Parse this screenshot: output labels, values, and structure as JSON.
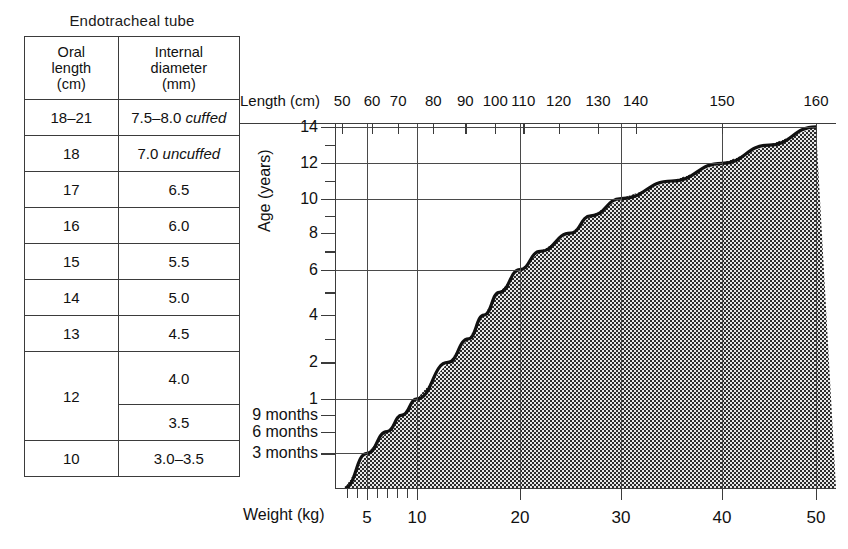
{
  "table": {
    "title": "Endotracheal tube",
    "headers": [
      "Oral\nlength\n(cm)",
      "Internal\ndiameter\n(mm)"
    ],
    "header_oral_line1": "Oral",
    "header_oral_line2": "length",
    "header_oral_line3": "(cm)",
    "header_diam_line1": "Internal",
    "header_diam_line2": "diameter",
    "header_diam_line3": "(mm)",
    "rows": [
      {
        "oral": "18–21",
        "diameter": "7.5–8.0 ",
        "diameter_note": "cuffed"
      },
      {
        "oral": "18",
        "diameter": "7.0 ",
        "diameter_note": "uncuffed"
      },
      {
        "oral": "17",
        "diameter": "6.5",
        "diameter_note": ""
      },
      {
        "oral": "16",
        "diameter": "6.0",
        "diameter_note": ""
      },
      {
        "oral": "15",
        "diameter": "5.5",
        "diameter_note": ""
      },
      {
        "oral": "14",
        "diameter": "5.0",
        "diameter_note": ""
      },
      {
        "oral": "13",
        "diameter": "4.5",
        "diameter_note": ""
      },
      {
        "oral": "12",
        "diameter": "4.0",
        "diameter_note": ""
      },
      {
        "oral": "",
        "diameter": "3.5",
        "diameter_note": ""
      },
      {
        "oral": "10",
        "diameter": "3.0–3.5",
        "diameter_note": ""
      }
    ]
  },
  "chart_data": {
    "type": "area",
    "title": "",
    "xlabel": "Weight (kg)",
    "ylabel": "Age (years)",
    "top_axis_label": "Length (cm)",
    "grid": true,
    "legend": "none",
    "shading": "checkerboard",
    "x_axis": {
      "name": "Weight (kg)",
      "labeled_ticks": [
        5,
        10,
        20,
        30,
        40,
        50
      ],
      "labeled_tick_text": [
        "5",
        "10",
        "20",
        "30",
        "40",
        "50"
      ],
      "minor_ticks": [
        3,
        4,
        6,
        7,
        8,
        9
      ],
      "gridlines_at": [
        5,
        10,
        20,
        30,
        40,
        50
      ],
      "xlim": [
        2,
        52
      ]
    },
    "top_axis": {
      "name": "Length (cm)",
      "ticks": [
        50,
        60,
        70,
        80,
        90,
        100,
        110,
        120,
        130,
        140,
        150,
        160
      ],
      "tick_text": [
        "50",
        "60",
        "70",
        "80",
        "90",
        "100",
        "110",
        "120",
        "130",
        "140",
        "150",
        "160"
      ]
    },
    "y_axis": {
      "name": "Age (years)",
      "tick_text": [
        "14",
        "12",
        "10",
        "8",
        "6",
        "4",
        "2",
        "1",
        "9 months",
        "6 months",
        "3 months"
      ],
      "tick_values_years": [
        14,
        12,
        10,
        8,
        6,
        4,
        2,
        1,
        0.75,
        0.5,
        0.25
      ],
      "gridlines_at_years": [
        14,
        12,
        10,
        6,
        1,
        0.25
      ],
      "ylim": [
        0,
        14.6
      ]
    },
    "series": [
      {
        "name": "Age vs weight (and length)",
        "points": [
          {
            "weight_kg": 2.8,
            "age_years": 0.0,
            "length_cm": 48
          },
          {
            "weight_kg": 5,
            "age_years": 0.25,
            "length_cm": 58
          },
          {
            "weight_kg": 7,
            "age_years": 0.5,
            "length_cm": 66
          },
          {
            "weight_kg": 8.5,
            "age_years": 0.75,
            "length_cm": 71
          },
          {
            "weight_kg": 10,
            "age_years": 1,
            "length_cm": 75
          },
          {
            "weight_kg": 13,
            "age_years": 2,
            "length_cm": 87
          },
          {
            "weight_kg": 15,
            "age_years": 3,
            "length_cm": 95
          },
          {
            "weight_kg": 16.5,
            "age_years": 4,
            "length_cm": 102
          },
          {
            "weight_kg": 18,
            "age_years": 5,
            "length_cm": 109
          },
          {
            "weight_kg": 20,
            "age_years": 6,
            "length_cm": 115
          },
          {
            "weight_kg": 22,
            "age_years": 7,
            "length_cm": 122
          },
          {
            "weight_kg": 25,
            "age_years": 8,
            "length_cm": 128
          },
          {
            "weight_kg": 27,
            "age_years": 9,
            "length_cm": 133
          },
          {
            "weight_kg": 30,
            "age_years": 10,
            "length_cm": 138
          },
          {
            "weight_kg": 35,
            "age_years": 11,
            "length_cm": 145
          },
          {
            "weight_kg": 40,
            "age_years": 12,
            "length_cm": 150
          },
          {
            "weight_kg": 45,
            "age_years": 13,
            "length_cm": 156
          },
          {
            "weight_kg": 50,
            "age_years": 14,
            "length_cm": 160
          }
        ]
      }
    ]
  }
}
